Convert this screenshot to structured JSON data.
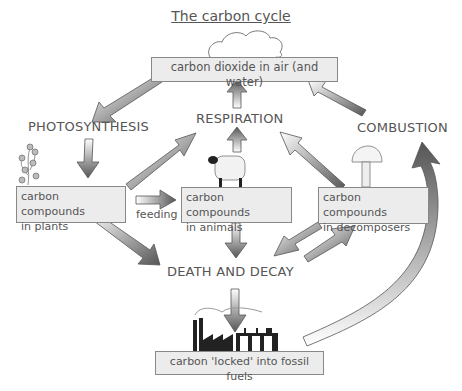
{
  "title": "The carbon cycle",
  "boxes": {
    "co2": "carbon dioxide in air (and water)",
    "plants_line1": "carbon compounds",
    "plants_line2": "in plants",
    "animals_line1": "carbon compounds",
    "animals_line2": "in animals",
    "decomposers_line1": "carbon compounds",
    "decomposers_line2": "in decomposers",
    "fossil": "carbon 'locked' into fossil fuels"
  },
  "processes": {
    "photosynthesis": "PHOTOSYNTHESIS",
    "respiration": "RESPIRATION",
    "combustion": "COMBUSTION",
    "death_decay": "DEATH AND DECAY",
    "feeding": "feeding"
  },
  "colors": {
    "box_fill": "#ececec",
    "box_border": "#888888",
    "arrow_dark": "#555555",
    "arrow_light": "#ffffff",
    "text": "#555555"
  }
}
